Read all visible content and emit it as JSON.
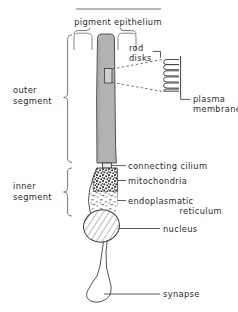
{
  "figure": {
    "style": "line-drawing",
    "colors": {
      "ink": "#3a3a3a",
      "text": "#2a2a2a",
      "outer_segment_fill": "#b0b0b0",
      "background": "#ffffff"
    }
  },
  "labels": {
    "pigment_epithelium": "pigment epithelium",
    "rod_disks_line1": "rod",
    "rod_disks_line2": "disks",
    "plasma_membrane_line1": "plasma",
    "plasma_membrane_line2": "membrane",
    "outer_segment_line1": "outer",
    "outer_segment_line2": "segment",
    "inner_segment_line1": "inner",
    "inner_segment_line2": "segment",
    "connecting_cilium": "connecting cilium",
    "mitochondria": "mitochondria",
    "endoplasmatic_line1": "endoplasmatic",
    "endoplasmatic_line2": "reticulum",
    "nucleus": "nucleus",
    "synapse": "synapse"
  },
  "structures": {
    "pigment_epithelium_cells": 3,
    "rod_disk_count": 6,
    "brackets": [
      "outer-segment-bracket",
      "inner-segment-bracket",
      "pigment-epithelium-brace"
    ],
    "regions": [
      "outer-segment",
      "connecting-cilium",
      "mitochondria-region",
      "endoplasmatic-reticulum-region",
      "nucleus",
      "axon",
      "synaptic-terminal"
    ]
  }
}
